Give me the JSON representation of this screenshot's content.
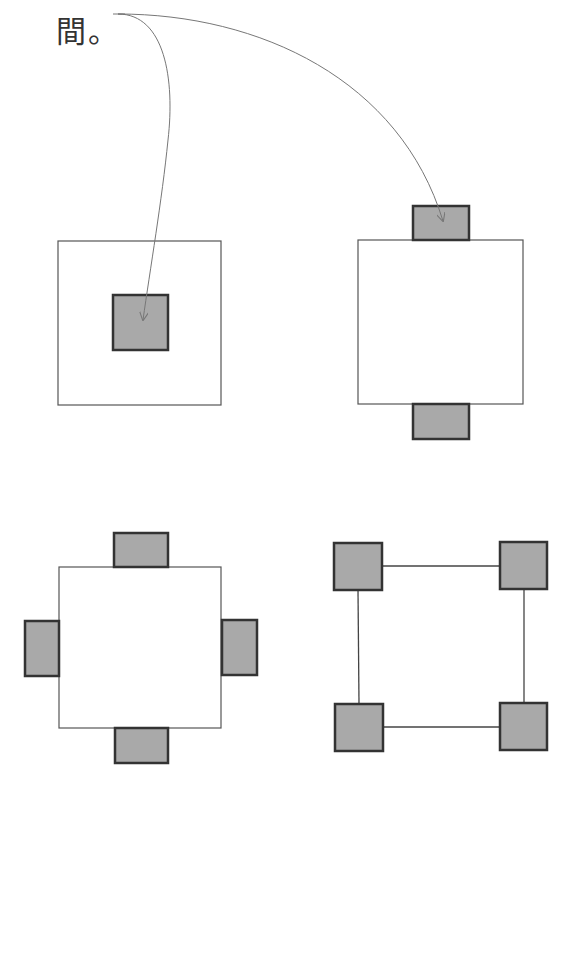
{
  "caption": {
    "text": "間。"
  },
  "colors": {
    "outline": "#555555",
    "tab_fill": "#a9a9a9",
    "tab_stroke": "#333333",
    "arrow": "#777777",
    "background": "#ffffff"
  },
  "diagrams": [
    {
      "id": "center-tab",
      "description": "square with one gray block in the center",
      "outer": {
        "x": 58,
        "y": 241,
        "w": 163,
        "h": 164
      },
      "tabs": [
        {
          "x": 113,
          "y": 295,
          "w": 55,
          "h": 55
        }
      ]
    },
    {
      "id": "top-bottom-tabs",
      "description": "square with gray blocks on top and bottom edges",
      "outer": {
        "x": 358,
        "y": 240,
        "w": 165,
        "h": 164
      },
      "tabs": [
        {
          "x": 413,
          "y": 206,
          "w": 56,
          "h": 34
        },
        {
          "x": 413,
          "y": 404,
          "w": 56,
          "h": 35
        }
      ]
    },
    {
      "id": "four-side-tabs",
      "description": "square with gray blocks on all four edges",
      "outer": {
        "x": 59,
        "y": 567,
        "w": 162,
        "h": 161
      },
      "tabs": [
        {
          "x": 114,
          "y": 533,
          "w": 54,
          "h": 34
        },
        {
          "x": 115,
          "y": 728,
          "w": 53,
          "h": 35
        },
        {
          "x": 25,
          "y": 621,
          "w": 34,
          "h": 55
        },
        {
          "x": 222,
          "y": 620,
          "w": 35,
          "h": 55
        }
      ]
    },
    {
      "id": "corner-blocks",
      "description": "four gray blocks at corners connected by lines",
      "outer": null,
      "tabs": [
        {
          "x": 334,
          "y": 543,
          "w": 48,
          "h": 47
        },
        {
          "x": 500,
          "y": 542,
          "w": 47,
          "h": 47
        },
        {
          "x": 335,
          "y": 704,
          "w": 48,
          "h": 47
        },
        {
          "x": 500,
          "y": 703,
          "w": 47,
          "h": 47
        }
      ],
      "lines": [
        {
          "x1": 382,
          "y1": 566,
          "x2": 500,
          "y2": 566
        },
        {
          "x1": 383,
          "y1": 727,
          "x2": 500,
          "y2": 727
        },
        {
          "x1": 358,
          "y1": 590,
          "x2": 359,
          "y2": 704
        },
        {
          "x1": 524,
          "y1": 589,
          "x2": 524,
          "y2": 703
        }
      ]
    }
  ],
  "arrows": [
    {
      "id": "arrow-to-center",
      "from": [
        113,
        14
      ],
      "to": [
        143,
        320
      ]
    },
    {
      "id": "arrow-to-top-tab",
      "from": [
        113,
        14
      ],
      "to": [
        443,
        221
      ]
    }
  ]
}
